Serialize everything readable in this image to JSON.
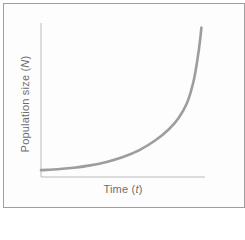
{
  "figure": {
    "ylabel": {
      "pre": "Population size (",
      "var": "N",
      "post": ")"
    },
    "xlabel": {
      "pre": "Time (",
      "var": "t",
      "post": ")"
    }
  },
  "colors": {
    "curve": "#9d9d9d",
    "axis": "#bcbcbc",
    "frame": "#9f9f9f",
    "text": "#6e6e6e",
    "panel_background": "#fdfdfd"
  },
  "chart_data": {
    "type": "line",
    "title": "",
    "xlabel": "Time (t)",
    "ylabel": "Population size (N)",
    "curve_shape": "exponential J-shaped growth",
    "xlim": [
      0,
      10
    ],
    "ylim": [
      0,
      100
    ],
    "grid": false,
    "legend": null,
    "tick_labels": "none",
    "x": [
      0,
      1,
      2,
      3,
      4,
      5,
      6,
      7,
      7.8,
      8.4,
      8.9,
      9.3,
      9.55,
      9.7,
      9.78
    ],
    "y": [
      4.5,
      5.0,
      6.0,
      7.5,
      9.8,
      13,
      17.5,
      24,
      31,
      38.5,
      48,
      62,
      77,
      89,
      97
    ]
  }
}
